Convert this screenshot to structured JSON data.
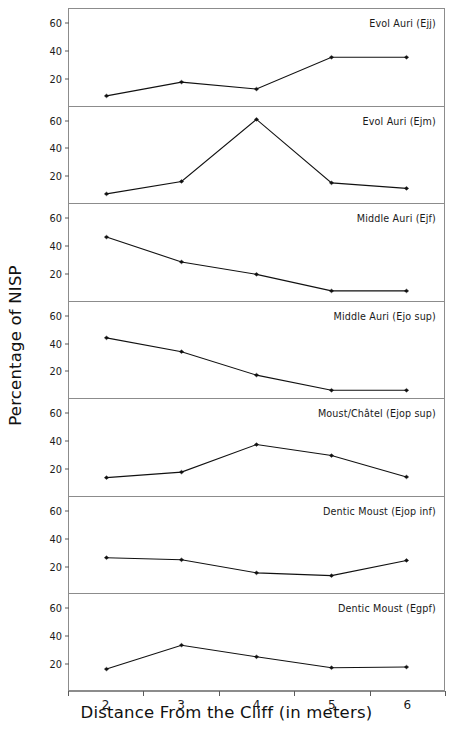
{
  "chart_data": {
    "type": "line",
    "title": "",
    "xlabel": "Distance From the Cliff (in meters)",
    "ylabel": "Percentage of NISP",
    "x": [
      2,
      3,
      4,
      5,
      6
    ],
    "xtick_labels": [
      "2",
      "3",
      "4",
      "5",
      "6"
    ],
    "ytick_labels": [
      "20",
      "40",
      "60"
    ],
    "yticks": [
      20,
      40,
      60
    ],
    "ylim": [
      0,
      70
    ],
    "xlim": [
      1.5,
      6.5
    ],
    "grid": false,
    "legend_position": "inside-top-right-per-panel",
    "marker": "filled-diamond",
    "line_color": "#111111",
    "panel_border_color": "#8c8c8c",
    "series": [
      {
        "name": "Evol Auri (Ejj)",
        "values": [
          7,
          17,
          12,
          35,
          35
        ]
      },
      {
        "name": "Evol Auri (Ejm)",
        "values": [
          7,
          16,
          61,
          15,
          11
        ]
      },
      {
        "name": "Middle Auri (Ejf)",
        "values": [
          46,
          28,
          19,
          7,
          7
        ]
      },
      {
        "name": "Middle Auri (Ejo sup)",
        "values": [
          44,
          34,
          17,
          6,
          6
        ]
      },
      {
        "name": "Moust/Châtel (Ejop sup)",
        "values": [
          13,
          17,
          37,
          29,
          13.5
        ]
      },
      {
        "name": "Dentic Moust (Ejop inf)",
        "values": [
          26,
          24.5,
          15,
          13,
          24
        ]
      },
      {
        "name": "Dentic Moust (Egpf)",
        "values": [
          15,
          32.5,
          24,
          16,
          16.5
        ]
      }
    ]
  },
  "axes": {
    "y_title": "Percentage of NISP",
    "x_title": "Distance From the Cliff (in meters)"
  },
  "caption": {
    "text": ""
  }
}
